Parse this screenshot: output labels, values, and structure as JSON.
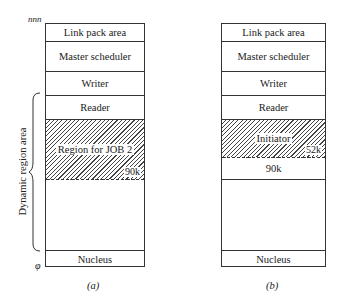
{
  "diagram_a": {
    "caption": "(a)",
    "top_marker": "nnn",
    "bottom_marker": "φ",
    "brace_label": "Dynamic region area",
    "blocks": [
      {
        "label": "Link pack area"
      },
      {
        "label": "Master scheduler"
      },
      {
        "label": "Writer"
      },
      {
        "label": "Reader"
      },
      {
        "label": "Region for JOB 2",
        "size": "90k",
        "hatched": true
      },
      {
        "label": ""
      },
      {
        "label": "Nucleus"
      }
    ]
  },
  "diagram_b": {
    "caption": "(b)",
    "blocks": [
      {
        "label": "Link pack area"
      },
      {
        "label": "Master scheduler"
      },
      {
        "label": "Writer"
      },
      {
        "label": "Reader"
      },
      {
        "label": "Initiator",
        "size": "52k",
        "hatched": true
      },
      {
        "label": "90k"
      },
      {
        "label": ""
      },
      {
        "label": "Nucleus"
      }
    ]
  }
}
